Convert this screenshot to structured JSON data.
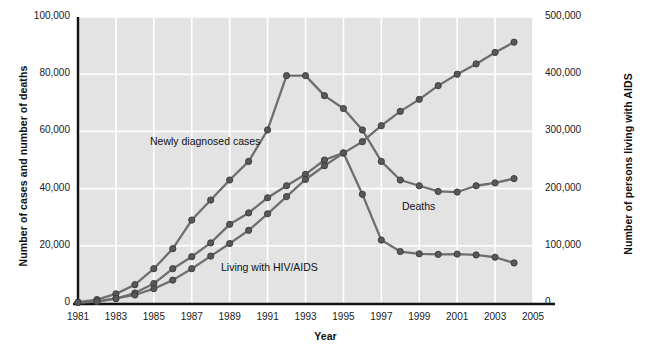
{
  "chart_data": {
    "type": "line",
    "title": "",
    "xlabel": "Year",
    "ylabel": "Number of cases and number of deaths",
    "ylabel_right": "Number of persons living with AIDS",
    "grid": true,
    "legend_position": "inline-annotations",
    "x": [
      1981,
      1982,
      1983,
      1984,
      1985,
      1986,
      1987,
      1988,
      1989,
      1990,
      1991,
      1992,
      1993,
      1994,
      1995,
      1996,
      1997,
      1998,
      1999,
      2000,
      2001,
      2002,
      2003,
      2004
    ],
    "xlim": [
      1981,
      2005
    ],
    "xticks": [
      1981,
      1983,
      1985,
      1987,
      1989,
      1991,
      1993,
      1995,
      1997,
      1999,
      2001,
      2003,
      2005
    ],
    "xticklabels": [
      "1981",
      "1983",
      "1985",
      "1987",
      "1989",
      "1991",
      "1993",
      "1995",
      "1997",
      "1999",
      "2001",
      "2003",
      "2005"
    ],
    "ylim": [
      0,
      100000
    ],
    "yticks": [
      0,
      20000,
      40000,
      60000,
      80000,
      100000
    ],
    "yticklabels": [
      "0",
      "20,000",
      "40,000",
      "60,000",
      "80,000",
      "100,000"
    ],
    "ylim_right": [
      0,
      500000
    ],
    "yticks_right": [
      0,
      100000,
      200000,
      300000,
      400000,
      500000
    ],
    "yticklabels_right": [
      "0",
      "100,000",
      "200,000",
      "300,000",
      "400,000",
      "500,000"
    ],
    "series": [
      {
        "name": "Newly diagnosed cases",
        "axis": "left",
        "values": [
          300,
          1200,
          3200,
          6400,
          12000,
          19000,
          29000,
          36000,
          43000,
          49500,
          60500,
          79500,
          79500,
          72500,
          68000,
          60500,
          49500,
          43000,
          41000,
          39000,
          38800,
          41000,
          42000,
          43500
        ]
      },
      {
        "name": "Deaths",
        "axis": "left",
        "values": [
          150,
          500,
          1500,
          3500,
          6800,
          12000,
          16200,
          21000,
          27500,
          31500,
          36800,
          41000,
          45000,
          50000,
          52500,
          38000,
          22000,
          18000,
          17200,
          17000,
          17100,
          16800,
          16000,
          14000
        ]
      },
      {
        "name": "Living with HIV/AIDS",
        "axis": "right",
        "values": [
          1000,
          3000,
          8000,
          14000,
          25000,
          40000,
          60000,
          82000,
          104000,
          127000,
          156000,
          186000,
          216000,
          240000,
          262000,
          282000,
          310000,
          335000,
          356000,
          380000,
          400000,
          418000,
          438000,
          456000
        ]
      }
    ],
    "annotations": [
      {
        "text": "Newly diagnosed cases",
        "series": "Newly diagnosed cases"
      },
      {
        "text": "Deaths",
        "series": "Deaths"
      },
      {
        "text": "Living with HIV/AIDS",
        "series": "Living with HIV/AIDS"
      }
    ],
    "colors": {
      "plot_background": "#e3e3e3",
      "gridline": "#ffffff",
      "axis_line": "#111111",
      "line": "#6e6e6e",
      "marker_fill": "#595959",
      "marker_stroke": "#3d3d3d",
      "page_background": "#ffffff"
    }
  },
  "axes": {
    "left_title": "Number of cases and number of deaths",
    "right_title": "Number of persons living with AIDS",
    "x_title": "Year"
  },
  "labels": {
    "newly_diagnosed": "Newly diagnosed cases",
    "deaths": "Deaths",
    "living": "Living with HIV/AIDS"
  }
}
